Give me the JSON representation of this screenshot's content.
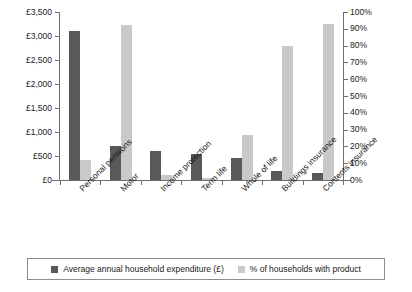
{
  "chart_data": {
    "type": "bar",
    "title": "",
    "subtitle": "",
    "xlabel": "",
    "ylabel": "",
    "ylabel_right": "",
    "grid": false,
    "legend_position": "bottom",
    "categories": [
      "Personal pensions",
      "Motor",
      "Income protection",
      "Term life",
      "Whole of life",
      "Buildings insurance",
      "Contents insurance"
    ],
    "left_axis": {
      "ticks": [
        "£0",
        "£500",
        "£1,000",
        "£1,500",
        "£2,000",
        "£2,500",
        "£3,000",
        "£3,500"
      ],
      "tick_values": [
        0,
        500,
        1000,
        1500,
        2000,
        2500,
        3000,
        3500
      ],
      "ylim": [
        0,
        3500
      ]
    },
    "right_axis": {
      "ticks": [
        "0%",
        "10%",
        "20%",
        "30%",
        "40%",
        "50%",
        "60%",
        "70%",
        "80%",
        "90%",
        "100%"
      ],
      "tick_values": [
        0,
        10,
        20,
        30,
        40,
        50,
        60,
        70,
        80,
        90,
        100
      ],
      "ylim": [
        0,
        100
      ]
    },
    "series": [
      {
        "name": "Average annual household expenditure (£)",
        "axis": "left",
        "color": "#595959",
        "values": [
          3100,
          700,
          600,
          550,
          460,
          180,
          140
        ]
      },
      {
        "name": "% of households with product",
        "axis": "right",
        "color": "#c9c9c9",
        "values": [
          12,
          92,
          3,
          1,
          27,
          80,
          93
        ]
      }
    ]
  },
  "legend": {
    "items": [
      {
        "label": "Average annual household expenditure (£)",
        "swatch": "expenditure"
      },
      {
        "label": "% of households with product",
        "swatch": "percentage"
      }
    ]
  }
}
